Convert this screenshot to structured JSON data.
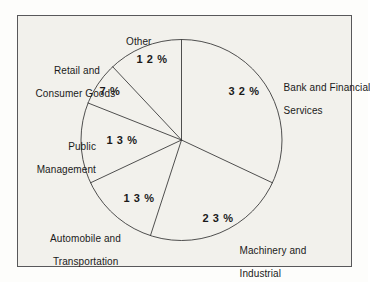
{
  "figure": {
    "background_color": "#f2f1ec",
    "border_color": "#58585a",
    "line_color": "#3c3c3c",
    "text_color": "#1a1a1a"
  },
  "chart_data": {
    "type": "pie",
    "title": "",
    "subtitle": "",
    "xlabel": "",
    "ylabel": "",
    "grid": false,
    "legend_position": "outside-labels",
    "start_angle_deg": 0,
    "direction": "clockwise",
    "units": "%",
    "categories": [
      "Bank and Financial Services",
      "Machinery and Industrial",
      "Automobile and Transportation",
      "Public Management",
      "Retail and Consumer Goods",
      "Other"
    ],
    "values": [
      32,
      23,
      13,
      13,
      7,
      12
    ],
    "total": 100,
    "slices": [
      {
        "label": "Bank and Financial Services",
        "label_line_1": "Bank and Financial",
        "label_line_2": "Services",
        "value": 32,
        "value_text": "3 2 %"
      },
      {
        "label": "Machinery and Industrial",
        "label_line_1": "Machinery and",
        "label_line_2": "Industrial",
        "value": 23,
        "value_text": "2 3 %"
      },
      {
        "label": "Automobile and Transportation",
        "label_line_1": "Automobile and",
        "label_line_2": "Transportation",
        "value": 13,
        "value_text": "1 3 %"
      },
      {
        "label": "Public Management",
        "label_line_1": "Public",
        "label_line_2": "Management",
        "value": 13,
        "value_text": "1 3 %"
      },
      {
        "label": "Retail and Consumer Goods",
        "label_line_1": "Retail and",
        "label_line_2": "Consumer Goods",
        "value": 7,
        "value_text": "7 %"
      },
      {
        "label": "Other",
        "label_line_1": "Other",
        "label_line_2": "",
        "value": 12,
        "value_text": "1 2 %"
      }
    ]
  }
}
